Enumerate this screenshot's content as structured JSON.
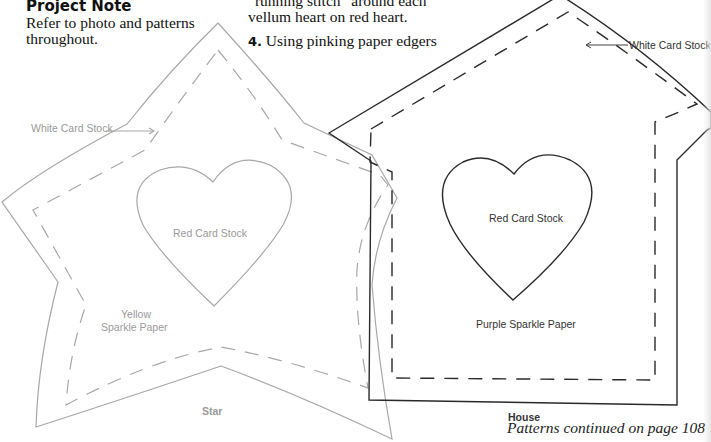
{
  "project_note": {
    "heading": "Project Note",
    "body": "Refer to photo and patterns throughout."
  },
  "instructions": {
    "partial_line_1": "“running stitch” around each",
    "partial_line_2": "vellum heart on red heart.",
    "step_4": {
      "number": "4.",
      "text": "Using pinking paper edgers"
    }
  },
  "patterns": {
    "star": {
      "title": "Star",
      "outer_label": "White Card Stock",
      "body_label_line1": "Yellow",
      "body_label_line2": "Sparkle Paper",
      "heart_label": "Red Card Stock",
      "line_color": "#a8a8a8"
    },
    "house": {
      "title": "House",
      "outer_label": "White Card Stock",
      "body_label": "Purple Sparkle Paper",
      "heart_label": "Red Card Stock",
      "line_color": "#2a2a2a"
    }
  },
  "footer": {
    "continued": "Patterns continued on page 108"
  }
}
